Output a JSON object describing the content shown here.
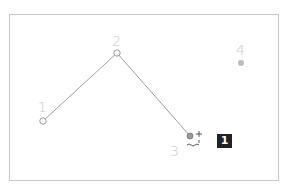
{
  "canvas": {
    "points": [
      {
        "id": "1",
        "label": "1",
        "x": 43,
        "y": 121,
        "style": "hollow"
      },
      {
        "id": "2",
        "label": "2",
        "x": 117,
        "y": 53,
        "style": "hollow"
      },
      {
        "id": "3",
        "label": "3",
        "x": 190,
        "y": 136,
        "style": "active"
      },
      {
        "id": "4",
        "label": "4",
        "x": 241,
        "y": 63,
        "style": "filled"
      }
    ],
    "connections": [
      [
        "1",
        "2"
      ],
      [
        "2",
        "3"
      ]
    ],
    "cursor": "add-point-cursor",
    "badge": "1"
  },
  "colors": {
    "line": "#999999",
    "label": "#c8c8c8",
    "point_fill_disabled": "#bbbbbb",
    "badge_bg": "#222222"
  }
}
